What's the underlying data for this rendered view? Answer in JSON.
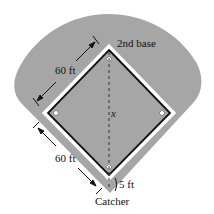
{
  "diagram": {
    "colors": {
      "field": "#a6a6a6",
      "infield": "#a6a6a6",
      "baseline_outer": "#ffffff",
      "baseline_inner": "#111111",
      "text": "#111111",
      "background": "#ffffff"
    },
    "labels": {
      "second_base": "2nd base",
      "upper_distance": "60 ft",
      "lower_distance": "60 ft",
      "diagonal": "x",
      "catcher_offset": "5 ft",
      "catcher": "Catcher"
    },
    "nodes": [
      {
        "id": "second-base",
        "label": "2nd base"
      },
      {
        "id": "first-base",
        "label": ""
      },
      {
        "id": "third-base",
        "label": ""
      },
      {
        "id": "home-plate",
        "label": ""
      },
      {
        "id": "catcher",
        "label": "Catcher"
      }
    ],
    "edges": [
      {
        "from": "home-plate",
        "to": "third-base",
        "label": "60 ft"
      },
      {
        "from": "third-base",
        "to": "second-base",
        "label": "60 ft"
      },
      {
        "from": "second-base",
        "to": "first-base",
        "label": ""
      },
      {
        "from": "first-base",
        "to": "home-plate",
        "label": ""
      },
      {
        "from": "second-base",
        "to": "catcher",
        "label": "x",
        "style": "dashed"
      },
      {
        "from": "home-plate",
        "to": "catcher",
        "label": "5 ft"
      }
    ]
  }
}
